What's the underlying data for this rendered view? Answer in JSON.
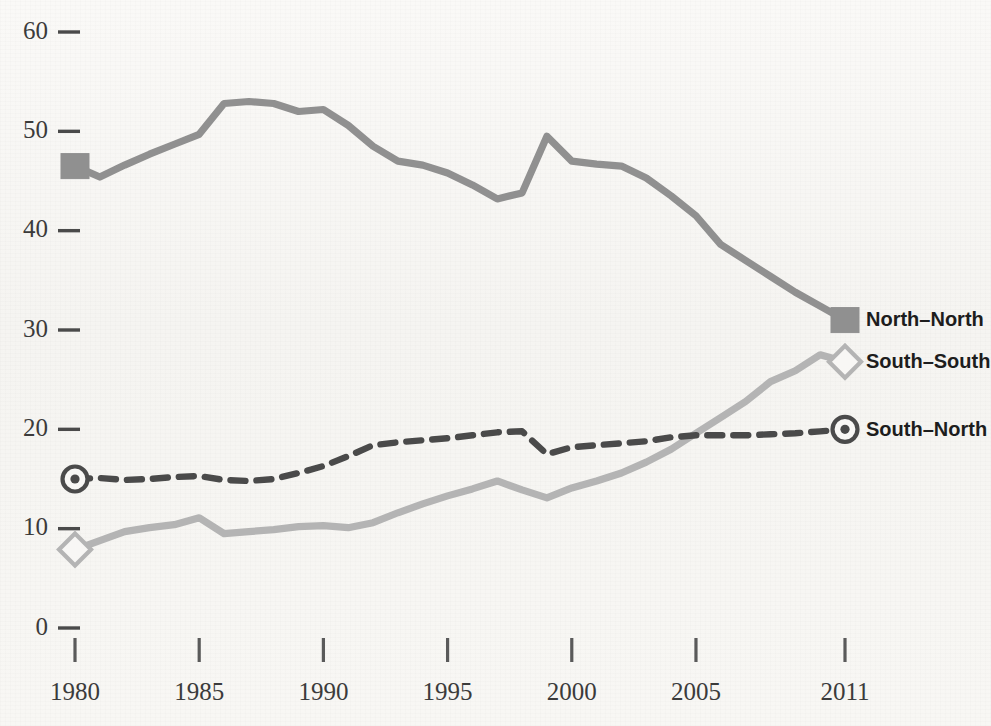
{
  "chart_data": {
    "type": "line",
    "title": "",
    "subtitle": "",
    "xlabel": "",
    "ylabel": "",
    "xlim": [
      1980,
      2011
    ],
    "ylim": [
      0,
      60
    ],
    "grid": false,
    "legend_position": "right-inline",
    "x_ticks": [
      "1980",
      "1985",
      "1990",
      "1995",
      "2000",
      "2005",
      "2011"
    ],
    "x_tick_values": [
      1980,
      1985,
      1990,
      1995,
      2000,
      2005,
      2011
    ],
    "y_ticks": [
      "0",
      "10",
      "20",
      "30",
      "40",
      "50",
      "60"
    ],
    "y_tick_values": [
      0,
      10,
      20,
      30,
      40,
      50,
      60
    ],
    "x": [
      1980,
      1981,
      1982,
      1983,
      1984,
      1985,
      1986,
      1987,
      1988,
      1989,
      1990,
      1991,
      1992,
      1993,
      1994,
      1995,
      1996,
      1997,
      1998,
      1999,
      2000,
      2001,
      2002,
      2003,
      2004,
      2005,
      2006,
      2007,
      2008,
      2009,
      2010,
      2011
    ],
    "series": [
      {
        "name": "North–North",
        "color": "#909090",
        "style": "solid",
        "marker": "square-filled",
        "values": [
          46.5,
          45.4,
          46.6,
          47.7,
          48.7,
          49.7,
          52.8,
          53.0,
          52.8,
          52.0,
          52.2,
          50.6,
          48.5,
          47.0,
          46.6,
          45.8,
          44.6,
          43.2,
          43.8,
          49.5,
          47.0,
          46.7,
          46.5,
          45.3,
          43.5,
          41.5,
          38.6,
          37.0,
          35.4,
          33.8,
          32.4,
          31.0
        ]
      },
      {
        "name": "South–South",
        "color": "#b4b4b4",
        "style": "solid",
        "marker": "diamond-open",
        "values": [
          7.9,
          8.8,
          9.7,
          10.1,
          10.4,
          11.1,
          9.5,
          9.7,
          9.9,
          10.2,
          10.3,
          10.1,
          10.6,
          11.6,
          12.5,
          13.3,
          14.0,
          14.8,
          13.9,
          13.1,
          14.1,
          14.8,
          15.6,
          16.7,
          18.0,
          19.6,
          21.2,
          22.8,
          24.8,
          25.9,
          27.5,
          26.8
        ]
      },
      {
        "name": "South–North",
        "color": "#4a4a4a",
        "style": "dashed",
        "marker": "circle-dot",
        "values": [
          15.0,
          15.1,
          14.9,
          15.0,
          15.2,
          15.3,
          14.9,
          14.8,
          15.0,
          15.6,
          16.3,
          17.3,
          18.4,
          18.7,
          18.9,
          19.1,
          19.4,
          19.7,
          19.8,
          17.5,
          18.2,
          18.4,
          18.6,
          18.8,
          19.2,
          19.4,
          19.4,
          19.4,
          19.5,
          19.6,
          19.8,
          20.0
        ]
      }
    ],
    "legend": [
      {
        "label": "North–North",
        "marker": "square-filled",
        "color": "#909090"
      },
      {
        "label": "South–South",
        "marker": "diamond-open",
        "color": "#b4b4b4"
      },
      {
        "label": "South–North",
        "marker": "circle-dot",
        "color": "#4a4a4a"
      }
    ]
  },
  "colors": {
    "background": "#f8f7f5",
    "axis_text": "#3b3b3b",
    "legend_text": "#1d1d1d",
    "north_north": "#909090",
    "south_south": "#b4b4b4",
    "south_north": "#4a4a4a"
  }
}
